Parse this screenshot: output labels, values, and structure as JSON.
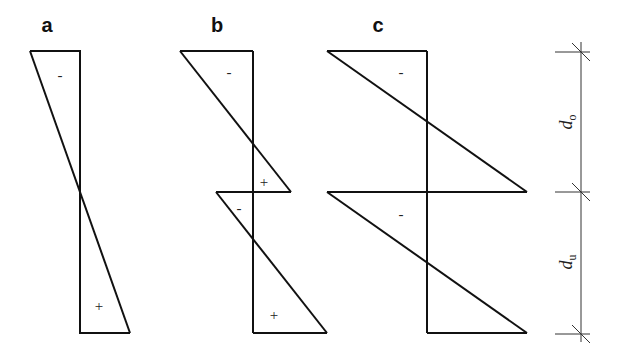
{
  "figure": {
    "panels": [
      {
        "label": "a",
        "description": "single linear distribution crossing zero at mid-height",
        "signs": [
          {
            "text": "-",
            "x": 60,
            "y": 80
          },
          {
            "text": "+",
            "x": 99,
            "y": 311
          }
        ]
      },
      {
        "label": "b",
        "description": "two linear distributions, upper and lower, each crossing zero",
        "signs": [
          {
            "text": "-",
            "x": 229,
            "y": 77
          },
          {
            "text": "+",
            "x": 264,
            "y": 187
          },
          {
            "text": "-",
            "x": 239,
            "y": 213
          },
          {
            "text": "+",
            "x": 274,
            "y": 320
          }
        ]
      },
      {
        "label": "c",
        "description": "two linear distributions spanning full width of each segment",
        "signs": [
          {
            "text": "-",
            "x": 401,
            "y": 77
          },
          {
            "text": "-",
            "x": 401,
            "y": 219
          }
        ]
      }
    ],
    "dimensions": {
      "upper": {
        "symbol": "d",
        "subscript": "o"
      },
      "lower": {
        "symbol": "d",
        "subscript": "u"
      }
    },
    "colors": {
      "line": "#111111",
      "dimension_line": "#333333",
      "background": "#ffffff"
    }
  }
}
